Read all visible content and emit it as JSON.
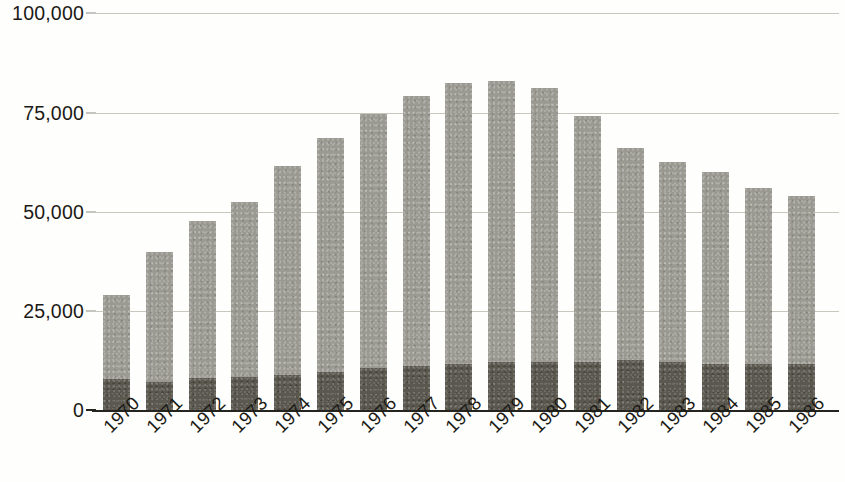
{
  "chart_data": {
    "type": "bar",
    "title": "",
    "subtitle": "",
    "xlabel": "",
    "ylabel": "",
    "stacked": true,
    "grid": true,
    "legend_position": "none",
    "ylim": [
      0,
      100000
    ],
    "yticks": [
      0,
      25000,
      50000,
      75000,
      100000
    ],
    "ytick_labels": [
      "0",
      "25,000",
      "50,000",
      "75,000",
      "100,000"
    ],
    "categories": [
      "1970",
      "1971",
      "1972",
      "1973",
      "1974",
      "1975",
      "1976",
      "1977",
      "1978",
      "1979",
      "1980",
      "1981",
      "1982",
      "1983",
      "1984",
      "1985",
      "1986"
    ],
    "series": [
      {
        "name": "lower-segment",
        "color": "#5a584f",
        "values": [
          7800,
          7000,
          8000,
          8300,
          8800,
          9500,
          10500,
          11200,
          11700,
          12000,
          12000,
          12200,
          12500,
          12000,
          11700,
          11500,
          11500
        ]
      },
      {
        "name": "upper-segment",
        "color": "#9b9a92",
        "values": [
          21200,
          32800,
          39500,
          44200,
          52700,
          59000,
          64000,
          67800,
          70800,
          71000,
          69000,
          61800,
          53500,
          50500,
          48300,
          44500,
          42500
        ]
      }
    ],
    "totals": [
      29000,
      39800,
      47500,
      52500,
      61500,
      68500,
      74500,
      79000,
      82500,
      83000,
      81000,
      74000,
      66000,
      62500,
      60000,
      56000,
      54000
    ]
  },
  "axis": {
    "y_tick_labels": [
      "100,000",
      "75,000",
      "50,000",
      "25,000",
      "0"
    ],
    "x_tick_labels": [
      "1970",
      "1971",
      "1972",
      "1973",
      "1974",
      "1975",
      "1976",
      "1977",
      "1978",
      "1979",
      "1980",
      "1981",
      "1982",
      "1983",
      "1984",
      "1985",
      "1986"
    ]
  },
  "colors": {
    "segment_upper": "#9b9a92",
    "segment_lower": "#5a584f",
    "gridline": "#c9c7bd",
    "axis_line": "#25241f",
    "text": "#1b1a16",
    "background": "#fefefc"
  }
}
